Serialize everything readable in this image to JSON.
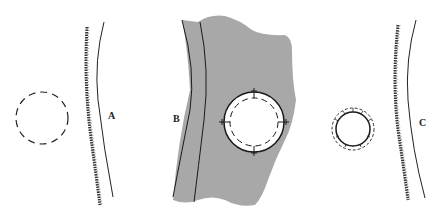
{
  "panels": [
    {
      "id": "A",
      "label": "A"
    },
    {
      "id": "B",
      "label": "B"
    },
    {
      "id": "C",
      "label": "C"
    }
  ],
  "colors": {
    "tissue_fill": "#a8a8a8",
    "line": "#1a1a1a",
    "background": "#ffffff"
  }
}
